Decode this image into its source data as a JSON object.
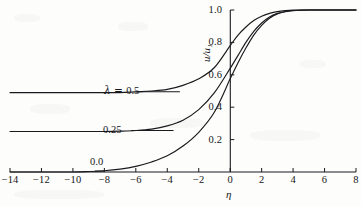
{
  "figure": {
    "name": "velocity-profile-plot",
    "background_color": "#fdfdfc",
    "ink_color": "#1a1a1e"
  },
  "axes": {
    "x_title": "η",
    "y_title": "u/u₁",
    "x_ticks": [
      "−14",
      "−12",
      "−10",
      "−8",
      "−6",
      "−4",
      "−2",
      "0",
      "2",
      "4",
      "6",
      "8"
    ],
    "y_ticks": [
      "1.0",
      "0.8",
      "0.6",
      "0.4",
      "0.2"
    ]
  },
  "curve_labels": {
    "lambda_half_prefix": "λ = ",
    "lambda_half_value": "0.5",
    "lambda_quarter": "0.25",
    "lambda_zero": "0.0"
  },
  "chart_data": {
    "type": "line",
    "title": "",
    "xlabel": "η",
    "ylabel": "u/u₁",
    "xlim": [
      -14,
      8
    ],
    "ylim": [
      0,
      1.0
    ],
    "xticks": [
      -14,
      -12,
      -10,
      -8,
      -6,
      -4,
      -2,
      0,
      2,
      4,
      6,
      8
    ],
    "yticks": [
      0.2,
      0.4,
      0.6,
      0.8,
      1.0
    ],
    "grid": false,
    "legend": "inline-curve-labels",
    "series": [
      {
        "name": "λ = 0.5",
        "label": "λ = 0.5",
        "x": [
          -14,
          -12,
          -10,
          -9,
          -8,
          -7,
          -6,
          -5,
          -4,
          -3,
          -2,
          -1,
          0,
          0.5,
          1,
          1.5,
          2,
          2.5,
          3,
          3.5,
          4,
          5,
          6,
          7,
          8
        ],
        "y": [
          0.49,
          0.49,
          0.49,
          0.49,
          0.49,
          0.49,
          0.495,
          0.5,
          0.51,
          0.535,
          0.575,
          0.645,
          0.78,
          0.845,
          0.895,
          0.935,
          0.962,
          0.979,
          0.99,
          0.996,
          0.999,
          1.0,
          1.0,
          1.0,
          1.0
        ]
      },
      {
        "name": "λ = 0.25",
        "label": "0.25",
        "x": [
          -14,
          -12,
          -10,
          -9,
          -8,
          -7,
          -6,
          -5,
          -4,
          -3,
          -2,
          -1,
          0,
          0.5,
          1,
          1.5,
          2,
          2.5,
          3,
          3.5,
          4,
          5,
          6,
          7,
          8
        ],
        "y": [
          0.25,
          0.25,
          0.25,
          0.25,
          0.25,
          0.252,
          0.256,
          0.265,
          0.285,
          0.32,
          0.385,
          0.49,
          0.64,
          0.72,
          0.8,
          0.868,
          0.92,
          0.957,
          0.979,
          0.991,
          0.997,
          1.0,
          1.0,
          1.0,
          1.0
        ]
      },
      {
        "name": "λ = 0.0",
        "label": "0.0",
        "x": [
          -14,
          -12,
          -10,
          -9,
          -8,
          -7,
          -6,
          -5,
          -4,
          -3,
          -2,
          -1,
          0,
          0.5,
          1,
          1.5,
          2,
          2.5,
          3,
          3.5,
          4,
          5,
          6,
          7,
          8
        ],
        "y": [
          0.0,
          0.0,
          0.0,
          0.003,
          0.008,
          0.018,
          0.035,
          0.062,
          0.1,
          0.16,
          0.245,
          0.37,
          0.575,
          0.675,
          0.765,
          0.845,
          0.905,
          0.949,
          0.975,
          0.989,
          0.996,
          1.0,
          1.0,
          1.0,
          1.0
        ]
      }
    ]
  },
  "leaders": {
    "lambda_half": {
      "from_x": -6.0,
      "to_x": -3.2,
      "y": 0.495
    },
    "lambda_quarter": {
      "from_x": -6.3,
      "to_x": -3.6,
      "y": 0.256
    },
    "lambda_zero": {
      "from_x": -8.6,
      "to_x": -8.0,
      "y": 0.006
    }
  }
}
